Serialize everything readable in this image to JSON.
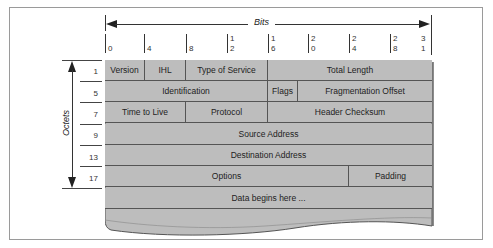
{
  "diagram": {
    "bits_axis": {
      "label": "Bits",
      "ticks": [
        {
          "label": "0",
          "x": 105
        },
        {
          "label": "4",
          "x": 144
        },
        {
          "label": "8",
          "x": 186
        },
        {
          "label": "12",
          "x": 227
        },
        {
          "label": "16",
          "x": 268
        },
        {
          "label": "20",
          "x": 308
        },
        {
          "label": "24",
          "x": 349
        },
        {
          "label": "28",
          "x": 390
        },
        {
          "label": "31",
          "x": 428
        }
      ]
    },
    "octets_axis": {
      "label": "Octets",
      "row_numbers": [
        "1",
        "5",
        "7",
        "9",
        "13",
        "17"
      ]
    },
    "rows": [
      {
        "cells": [
          {
            "label": "Version",
            "width": 40
          },
          {
            "label": "IHL",
            "width": 41
          },
          {
            "label": "Type of Service",
            "width": 82
          },
          {
            "label": "Total Length",
            "width": 164
          }
        ]
      },
      {
        "cells": [
          {
            "label": "Identification",
            "width": 163
          },
          {
            "label": "Flags",
            "width": 30
          },
          {
            "label": "Fragmentation Offset",
            "width": 134
          }
        ]
      },
      {
        "cells": [
          {
            "label": "Time to Live",
            "width": 81
          },
          {
            "label": "Protocol",
            "width": 82
          },
          {
            "label": "Header Checksum",
            "width": 164
          }
        ]
      },
      {
        "cells": [
          {
            "label": "Source Address",
            "width": 327
          }
        ]
      },
      {
        "cells": [
          {
            "label": "Destination Address",
            "width": 327
          }
        ]
      },
      {
        "cells": [
          {
            "label": "Options",
            "width": 244
          },
          {
            "label": "Padding",
            "width": 83
          }
        ]
      },
      {
        "cells": [
          {
            "label": "Data begins here ...",
            "width": 327
          }
        ]
      }
    ],
    "colors": {
      "cell_fill": "#bdbdbd",
      "cell_border": "#555555",
      "frame_border": "#9a9a9a"
    }
  }
}
